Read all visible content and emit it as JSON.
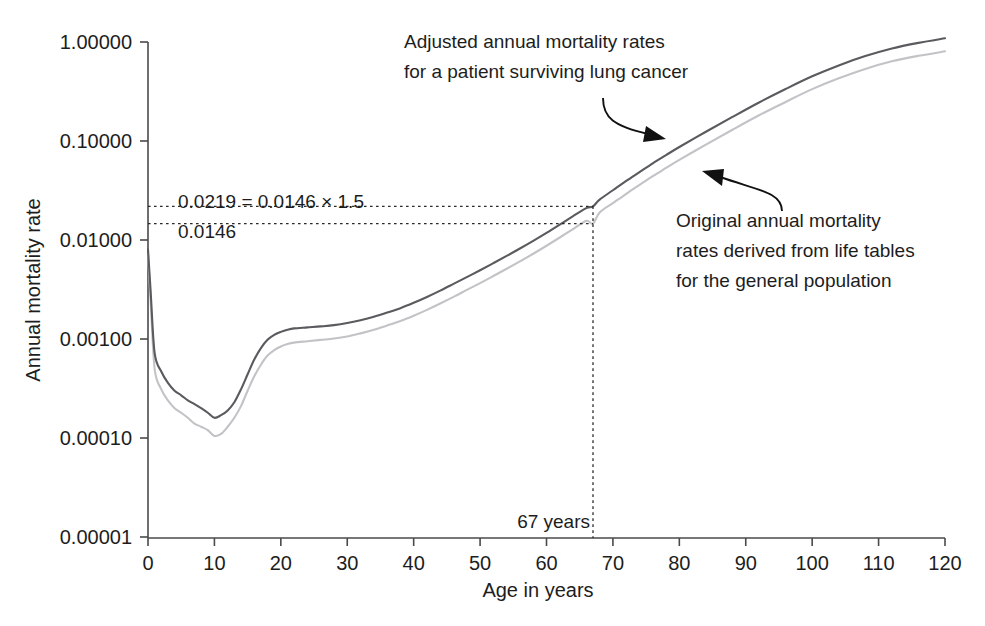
{
  "chart_data": {
    "type": "line",
    "title": "",
    "xlabel": "Age in years",
    "ylabel": "Annual mortality rate",
    "yscale": "log",
    "ylim": [
      1e-05,
      1.0
    ],
    "xlim": [
      0,
      120
    ],
    "grid": false,
    "legend_position": "none",
    "xticks": [
      0,
      10,
      20,
      30,
      40,
      50,
      60,
      70,
      80,
      90,
      100,
      110,
      120
    ],
    "xtick_labels": [
      "0",
      "10",
      "20",
      "30",
      "40",
      "50",
      "60",
      "70",
      "80",
      "90",
      "100",
      "110",
      "120"
    ],
    "yticks": [
      1.0,
      0.1,
      0.01,
      0.001,
      0.0001,
      1e-05
    ],
    "ytick_labels": [
      "1.00000",
      "0.10000",
      "0.01000",
      "0.00100",
      "0.00010",
      "0.00001"
    ],
    "series": [
      {
        "name": "Adjusted annual mortality rates for a patient surviving lung cancer",
        "color": "#5a5a5f",
        "x": [
          0,
          0.4,
          1,
          2,
          3,
          4,
          5,
          6,
          7,
          8,
          9,
          10,
          11,
          12,
          13,
          14,
          15,
          16,
          17,
          18,
          19,
          20,
          21,
          22,
          24,
          26,
          28,
          30,
          32,
          34,
          36,
          38,
          40,
          42,
          44,
          46,
          48,
          50,
          52,
          54,
          56,
          58,
          60,
          62,
          64,
          66,
          67,
          68,
          70,
          72,
          74,
          76,
          78,
          80,
          84,
          88,
          92,
          96,
          100,
          104,
          108,
          112,
          116,
          120
        ],
        "y": [
          0.008,
          0.003,
          0.00072,
          0.00047,
          0.00036,
          0.0003,
          0.00027,
          0.00024,
          0.00022,
          0.0002,
          0.00018,
          0.00016,
          0.00017,
          0.00019,
          0.00023,
          0.00031,
          0.00044,
          0.00062,
          0.00081,
          0.00098,
          0.0011,
          0.00118,
          0.00124,
          0.00128,
          0.00131,
          0.00134,
          0.00138,
          0.00145,
          0.00155,
          0.00168,
          0.00185,
          0.00205,
          0.00232,
          0.00266,
          0.00308,
          0.0036,
          0.00422,
          0.00495,
          0.00584,
          0.0069,
          0.0082,
          0.0098,
          0.0118,
          0.0143,
          0.0174,
          0.021,
          0.0219,
          0.0256,
          0.0318,
          0.0395,
          0.0485,
          0.0595,
          0.072,
          0.087,
          0.124,
          0.175,
          0.245,
          0.335,
          0.45,
          0.58,
          0.72,
          0.86,
          0.98,
          1.09
        ]
      },
      {
        "name": "Original annual mortality rates derived from life tables for the general population",
        "color": "#c3c3c7",
        "x": [
          0,
          0.4,
          1,
          2,
          3,
          4,
          5,
          6,
          7,
          8,
          9,
          10,
          11,
          12,
          13,
          14,
          15,
          16,
          17,
          18,
          19,
          20,
          21,
          22,
          24,
          26,
          28,
          30,
          32,
          34,
          36,
          38,
          40,
          42,
          44,
          46,
          48,
          50,
          52,
          54,
          56,
          58,
          60,
          62,
          64,
          66,
          67,
          68,
          70,
          72,
          74,
          76,
          78,
          80,
          84,
          88,
          92,
          96,
          100,
          104,
          108,
          112,
          116,
          120
        ],
        "y": [
          0.0072,
          0.0024,
          0.0005,
          0.00031,
          0.00024,
          0.0002,
          0.00018,
          0.00016,
          0.00014,
          0.00013,
          0.00012,
          0.000105,
          0.00011,
          0.00013,
          0.00016,
          0.00021,
          0.0003,
          0.00042,
          0.00055,
          0.00068,
          0.00077,
          0.00084,
          0.00089,
          0.00092,
          0.00095,
          0.00098,
          0.00101,
          0.00106,
          0.00114,
          0.00124,
          0.00137,
          0.00152,
          0.00172,
          0.00197,
          0.00228,
          0.00266,
          0.00313,
          0.00367,
          0.00433,
          0.00512,
          0.00608,
          0.00726,
          0.00875,
          0.0106,
          0.0129,
          0.0156,
          0.0146,
          0.019,
          0.0236,
          0.0293,
          0.036,
          0.0441,
          0.0534,
          0.0645,
          0.092,
          0.13,
          0.182,
          0.248,
          0.334,
          0.43,
          0.535,
          0.638,
          0.725,
          0.805
        ]
      }
    ],
    "annotations": [
      {
        "id": "adjusted-callout",
        "lines": [
          "Adjusted annual mortality rates",
          "for a patient surviving lung cancer"
        ]
      },
      {
        "id": "original-callout",
        "lines": [
          "Original annual mortality",
          "rates derived from life tables",
          "for the general population"
        ]
      }
    ],
    "reference_markers": {
      "upper_value_label": "0.0219 = 0.0146 × 1.5",
      "lower_value_label": "0.0146",
      "upper_value": 0.0219,
      "lower_value": 0.0146,
      "age_label": "67 years",
      "age_value": 67
    }
  }
}
